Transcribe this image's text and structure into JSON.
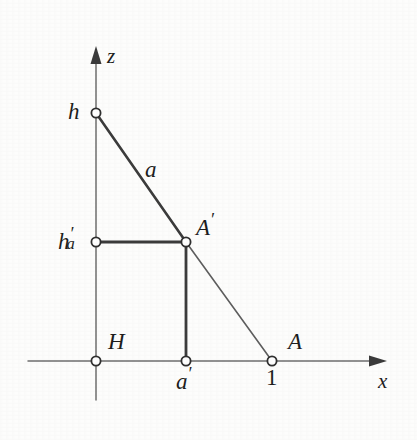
{
  "figure": {
    "kind": "geometric-diagram",
    "background_color": "#fdfdfc",
    "ink_color": "#2b2b2b",
    "thin_line_color": "#6e6e6e",
    "canvas": {
      "width": 417,
      "height": 440
    }
  },
  "axes": {
    "x": {
      "label": "x",
      "label_pos": {
        "x": 378,
        "y": 371
      },
      "line": {
        "x1": 28,
        "y1": 361,
        "x2": 379,
        "y2": 361
      },
      "arrow_tip": {
        "x": 387,
        "y": 361
      }
    },
    "z": {
      "label": "z",
      "label_pos": {
        "x": 107,
        "y": 46
      },
      "line": {
        "x1": 96,
        "y1": 400,
        "x2": 96,
        "y2": 56
      },
      "arrow_tip": {
        "x": 96,
        "y": 46
      }
    }
  },
  "points": [
    {
      "id": "h",
      "label": "h",
      "prime": false,
      "subscript": "",
      "x": 96,
      "y": 113,
      "label_pos": {
        "x": 68,
        "y": 100
      }
    },
    {
      "id": "h_a_prime",
      "label": "h",
      "prime": true,
      "subscript": "a",
      "x": 96,
      "y": 242,
      "label_pos": {
        "x": 58,
        "y": 226
      }
    },
    {
      "id": "A_prime",
      "label": "A",
      "prime": true,
      "subscript": "",
      "x": 186,
      "y": 242,
      "label_pos": {
        "x": 196,
        "y": 212
      }
    },
    {
      "id": "H",
      "label": "H",
      "prime": false,
      "subscript": "",
      "x": 96,
      "y": 361,
      "label_pos": {
        "x": 108,
        "y": 330
      }
    },
    {
      "id": "a_prime",
      "label": "a",
      "prime": true,
      "subscript": "",
      "x": 186,
      "y": 361,
      "label_pos": {
        "x": 176,
        "y": 366
      }
    },
    {
      "id": "A",
      "label": "A",
      "prime": false,
      "subscript": "",
      "x": 272,
      "y": 361,
      "label_pos": {
        "x": 288,
        "y": 330
      }
    }
  ],
  "tick_labels": [
    {
      "id": "one",
      "text": "1",
      "x": 266,
      "y": 366
    }
  ],
  "segments": [
    {
      "id": "h-to-Aprime",
      "from": "h",
      "to": "A_prime",
      "weight": "thick",
      "x1": 96,
      "y1": 113,
      "x2": 186,
      "y2": 242
    },
    {
      "id": "Aprime-to-A",
      "from": "A_prime",
      "to": "A",
      "weight": "thin",
      "x1": 186,
      "y1": 242,
      "x2": 272,
      "y2": 361
    },
    {
      "id": "haprime-to-Aprime",
      "from": "h_a_prime",
      "to": "A_prime",
      "weight": "thick",
      "x1": 96,
      "y1": 242,
      "x2": 186,
      "y2": 242
    },
    {
      "id": "Aprime-to-aprime",
      "from": "A_prime",
      "to": "a_prime",
      "weight": "thick",
      "x1": 186,
      "y1": 242,
      "x2": 186,
      "y2": 361
    }
  ],
  "annotations": [
    {
      "id": "segment-label-a",
      "text": "a",
      "x": 145,
      "y": 158
    }
  ],
  "marker": {
    "radius": 4.6,
    "stroke_width": 1.8,
    "fill": "#ffffff",
    "stroke": "#2f2f2f"
  }
}
